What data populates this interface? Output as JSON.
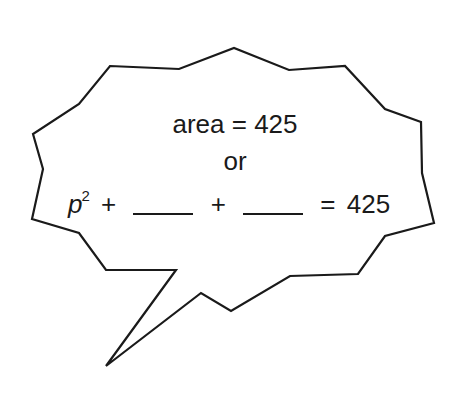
{
  "bubble": {
    "shape": "jagged speech bubble",
    "stroke_color": "#1a1a1a",
    "fill_color": "#ffffff",
    "points": "110,66 179,69 234,48 289,70 345,66 385,109 421,122 422,173 434,223 385,236 358,274 290,276 231,311 201,293 106,366 176,270 106,270 79,233 32,219 43,169 33,134 79,104"
  },
  "text": {
    "line1": "area = 425",
    "line2": "or",
    "line3": {
      "variable": "p",
      "exponent": "2",
      "plus1": "+",
      "blank1": "",
      "plus2": "+",
      "blank2": "",
      "equals": "=",
      "result": "425"
    }
  }
}
